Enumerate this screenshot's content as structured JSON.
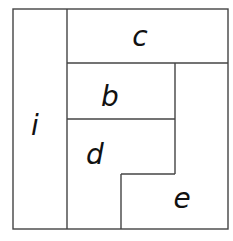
{
  "diagram": {
    "type": "rectangular partition puzzle",
    "line_color": "#444444",
    "background": "#ffffff",
    "regions": [
      {
        "id": "i",
        "label": "i",
        "x": 35,
        "y": 135
      },
      {
        "id": "c",
        "label": "c",
        "x": 140,
        "y": 46
      },
      {
        "id": "b",
        "label": "b",
        "x": 110,
        "y": 106
      },
      {
        "id": "d",
        "label": "d",
        "x": 95,
        "y": 164
      },
      {
        "id": "e",
        "label": "e",
        "x": 182,
        "y": 208
      }
    ]
  }
}
